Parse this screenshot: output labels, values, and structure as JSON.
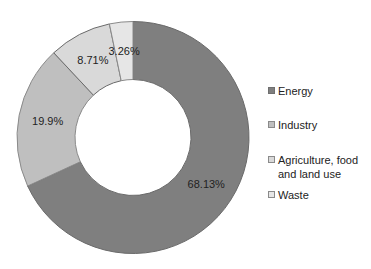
{
  "chart_data": {
    "type": "pie",
    "variant": "donut",
    "title": "",
    "categories": [
      "Energy",
      "Industry",
      "Agriculture, food and land use",
      "Waste"
    ],
    "values": [
      68.13,
      19.9,
      8.71,
      3.26
    ],
    "labels": [
      "68.13%",
      "19.9%",
      "8.71%",
      "3.26%"
    ],
    "colors": [
      "#7f7f7f",
      "#bfbfbf",
      "#d9d9d9",
      "#e6e6e6"
    ],
    "legend_position": "right",
    "start_angle_deg": 0,
    "direction": "clockwise"
  },
  "legend": {
    "items": [
      {
        "label": "Energy",
        "color": "#7f7f7f"
      },
      {
        "label": "Industry",
        "color": "#bfbfbf"
      },
      {
        "label_line1": "Agriculture, food",
        "label_line2": "and land use",
        "color": "#d9d9d9"
      },
      {
        "label": "Waste",
        "color": "#e6e6e6"
      }
    ]
  }
}
